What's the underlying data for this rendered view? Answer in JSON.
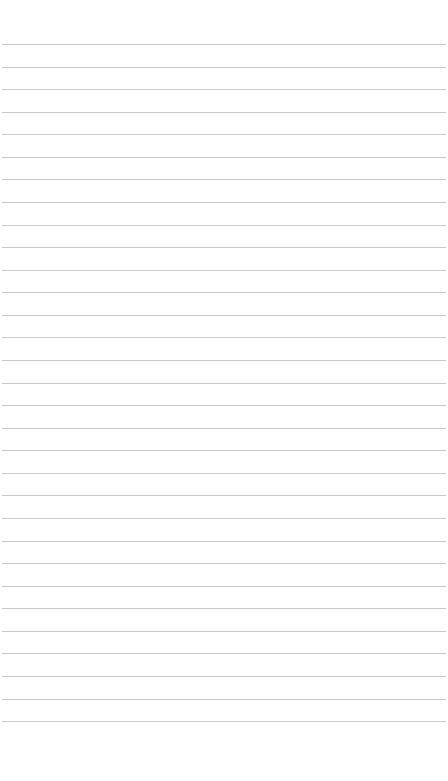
{
  "page": {
    "type": "lined-paper",
    "background": "#ffffff",
    "line_color": "#c9c9c9",
    "line_count": 31,
    "first_line_y": 44,
    "line_spacing": 22.57
  }
}
